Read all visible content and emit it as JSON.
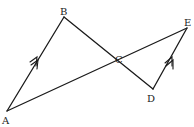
{
  "diagram": {
    "type": "geometry",
    "points": {
      "A": {
        "label": "A",
        "x": 7,
        "y": 111
      },
      "B": {
        "label": "B",
        "x": 64,
        "y": 17
      },
      "C": {
        "label": "C",
        "x": 119,
        "y": 63
      },
      "D": {
        "label": "D",
        "x": 153,
        "y": 89
      },
      "E": {
        "label": "E",
        "x": 187,
        "y": 28
      }
    },
    "segments": [
      {
        "from": "A",
        "to": "B",
        "marker": "double-arrow"
      },
      {
        "from": "B",
        "to": "D",
        "through": "C"
      },
      {
        "from": "A",
        "to": "E",
        "through": "C"
      },
      {
        "from": "D",
        "to": "E",
        "marker": "double-arrow"
      }
    ],
    "parallel": [
      "AB",
      "DE"
    ],
    "labels": {
      "A": "A",
      "B": "B",
      "C": "C",
      "D": "D",
      "E": "E"
    }
  }
}
